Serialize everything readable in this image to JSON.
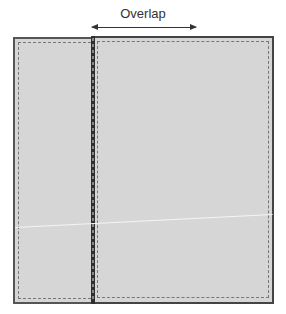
{
  "diagram": {
    "title_label": "Overlap",
    "panels": [
      {
        "name": "left-panel",
        "role": "underlap"
      },
      {
        "name": "right-panel",
        "role": "overlap"
      }
    ],
    "colors": {
      "panel_fill": "#d6d6d6",
      "border": "#444444",
      "stitch": "#777777",
      "text": "#333333"
    }
  }
}
